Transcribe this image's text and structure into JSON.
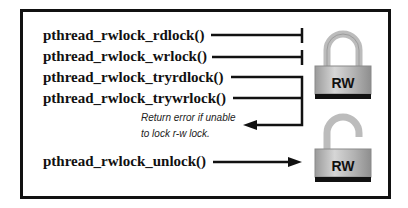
{
  "diagram": {
    "functions": [
      {
        "label": "pthread_rwlock_rdlock()",
        "connector": "blocked"
      },
      {
        "label": "pthread_rwlock_wrlock()",
        "connector": "blocked"
      },
      {
        "label": "pthread_rwlock_tryrdlock()",
        "connector": "return-error"
      },
      {
        "label": "pthread_rwlock_trywrlock()",
        "connector": "return-error"
      },
      {
        "label": "pthread_rwlock_unlock()",
        "connector": "arrow-to-unlocked"
      }
    ],
    "note": {
      "line1": "Return error if unable",
      "line2": "to lock r-w lock."
    },
    "locks": [
      {
        "state": "locked",
        "label": "RW"
      },
      {
        "state": "unlocked",
        "label": "RW"
      }
    ],
    "colors": {
      "border": "#111111",
      "lock_body": "#b9b9b9",
      "lock_shackle": "#bdbdbd",
      "lock_base": "#111111"
    }
  }
}
